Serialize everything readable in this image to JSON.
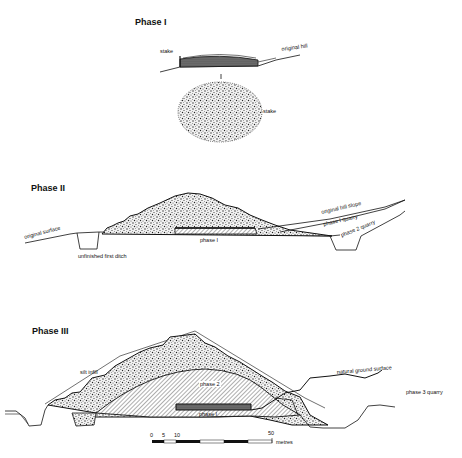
{
  "figure": {
    "phases": [
      {
        "title": "Phase I",
        "labels": {
          "stake_section": "stake",
          "original_hill": "original hill",
          "stake_plan": "stake"
        }
      },
      {
        "title": "Phase II",
        "labels": {
          "original_surface": "original surface",
          "unfinished_ditch": "unfinished first ditch",
          "phase1": "phase I",
          "original_hill_slope": "original hill slope",
          "phase1_quarry": "phase I quarry",
          "phase2_quarry": "phase 2 quarry"
        }
      },
      {
        "title": "Phase III",
        "labels": {
          "silt_infill": "silt infill",
          "phase2": "phase 2",
          "phase1": "phase I",
          "natural_ground_surface": "natural ground surface",
          "phase3_quarry": "phase 3 quarry"
        }
      }
    ],
    "scale_bar": {
      "ticks": [
        "0",
        "5",
        "10",
        "50"
      ],
      "unit": "metres"
    },
    "colors": {
      "ink": "#111111",
      "stipple": "#555555",
      "background": "#ffffff"
    }
  }
}
